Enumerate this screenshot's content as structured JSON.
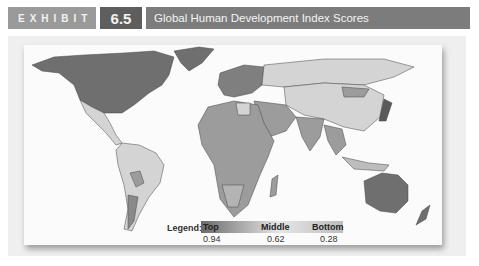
{
  "header": {
    "exhibit_label": "EXHIBIT",
    "exhibit_number": "6.5",
    "title": "Global Human Development Index Scores"
  },
  "legend": {
    "label": "Legend:",
    "stops": [
      {
        "name": "Top",
        "value": "0.94",
        "color": "#6a6a6a"
      },
      {
        "name": "Middle",
        "value": "0.62",
        "color": "#e6e6e6"
      },
      {
        "name": "Bottom",
        "value": "0.28",
        "color": "#bdbdbd"
      }
    ]
  },
  "map": {
    "type": "choropleth",
    "metric": "Human Development Index",
    "regions": [
      {
        "name": "North America",
        "shade": "top"
      },
      {
        "name": "Central America",
        "shade": "middle"
      },
      {
        "name": "South America",
        "shade": "middle"
      },
      {
        "name": "Europe",
        "shade": "top"
      },
      {
        "name": "Russia",
        "shade": "middle"
      },
      {
        "name": "Asia",
        "shade": "middle"
      },
      {
        "name": "Middle East",
        "shade": "mixed"
      },
      {
        "name": "Africa",
        "shade": "bottom"
      },
      {
        "name": "Australia",
        "shade": "top"
      },
      {
        "name": "New Zealand",
        "shade": "top"
      }
    ]
  },
  "colors": {
    "exhibit_bg": "#9a9a9a",
    "number_bg": "#5e5e5e",
    "title_bg": "#7c7c7c",
    "top": "#6f6f6f",
    "middle": "#d4d4d4",
    "bottom": "#9c9c9c"
  }
}
